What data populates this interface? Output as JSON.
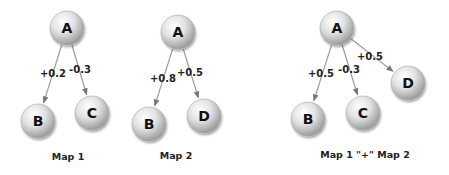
{
  "diagram": {
    "maps": [
      {
        "title": "Map 1",
        "title_pos": [
          68,
          160
        ],
        "nodes": [
          {
            "id": "A",
            "label": "A",
            "x": 67,
            "y": 28
          },
          {
            "id": "B",
            "label": "B",
            "x": 38,
            "y": 121
          },
          {
            "id": "C",
            "label": "C",
            "x": 92,
            "y": 113
          }
        ],
        "edges": [
          {
            "from": "A",
            "to": "B",
            "label": "+0.2",
            "label_pos": [
              53,
              77
            ]
          },
          {
            "from": "A",
            "to": "C",
            "label": "-0.3",
            "label_pos": [
              80,
              73
            ]
          }
        ]
      },
      {
        "title": "Map 2",
        "title_pos": [
          176,
          159
        ],
        "nodes": [
          {
            "id": "A",
            "label": "A",
            "x": 178,
            "y": 32
          },
          {
            "id": "B",
            "label": "B",
            "x": 149,
            "y": 124
          },
          {
            "id": "D",
            "label": "D",
            "x": 204,
            "y": 116
          }
        ],
        "edges": [
          {
            "from": "A",
            "to": "B",
            "label": "+0.8",
            "label_pos": [
              163,
              82
            ]
          },
          {
            "from": "A",
            "to": "D",
            "label": "+0.5",
            "label_pos": [
              190,
              76
            ]
          }
        ]
      },
      {
        "title": "Map 1 \"+\" Map 2",
        "title_pos": [
          365,
          158
        ],
        "nodes": [
          {
            "id": "A",
            "label": "A",
            "x": 337,
            "y": 28
          },
          {
            "id": "B",
            "label": "B",
            "x": 308,
            "y": 119
          },
          {
            "id": "C",
            "label": "C",
            "x": 363,
            "y": 113
          },
          {
            "id": "D",
            "label": "D",
            "x": 408,
            "y": 83
          }
        ],
        "edges": [
          {
            "from": "A",
            "to": "B",
            "label": "+0.5",
            "label_pos": [
              321,
              77
            ]
          },
          {
            "from": "A",
            "to": "C",
            "label": "-0.3",
            "label_pos": [
              349,
              73
            ]
          },
          {
            "from": "A",
            "to": "D",
            "label": "+0.5",
            "label_pos": [
              370,
              60
            ]
          }
        ]
      }
    ],
    "colors": {
      "node_fill_light": "#f4f4f4",
      "node_fill_dark": "#9c9c9c",
      "edge": "#9a9a9a",
      "text": "#111111"
    },
    "node_radius": 17
  }
}
